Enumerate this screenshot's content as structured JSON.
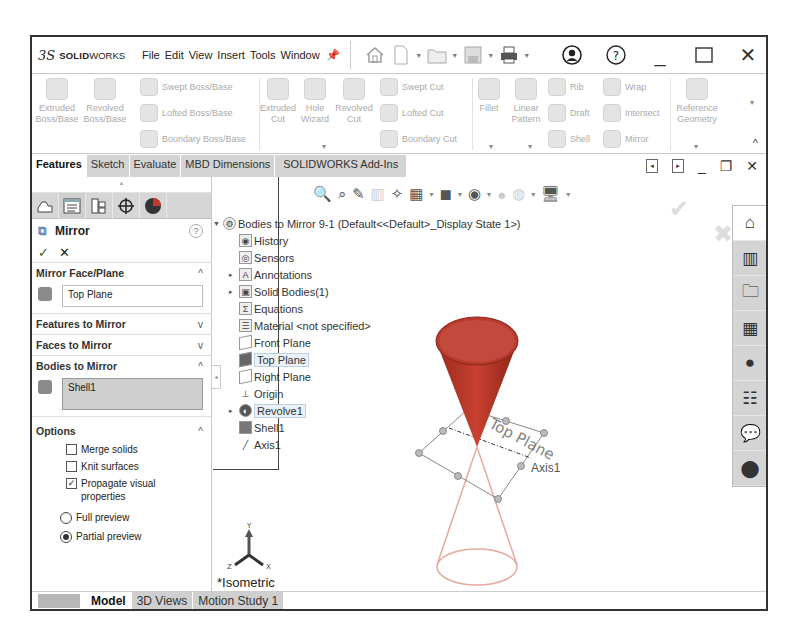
{
  "app": {
    "logo_prefix": "3S",
    "logo_bold": "SOLID",
    "logo_light": "WORKS"
  },
  "menu": [
    "File",
    "Edit",
    "View",
    "Insert",
    "Tools",
    "Window"
  ],
  "quick_access_icons": [
    "home-icon",
    "new-document-icon",
    "open-folder-icon",
    "save-icon",
    "print-icon"
  ],
  "window_controls": {
    "user_icon": "user-icon",
    "help_icon": "?",
    "minimize": "_",
    "maximize": "☐",
    "close": "✕"
  },
  "ribbon": {
    "extruded_boss": "Extruded Boss/Base",
    "revolved_boss": "Revolved Boss/Base",
    "swept_boss": "Swept Boss/Base",
    "lofted_boss": "Lofted Boss/Base",
    "boundary_boss": "Boundary Boss/Base",
    "extruded_cut": "Extruded Cut",
    "hole_wizard": "Hole Wizard",
    "revolved_cut": "Revolved Cut",
    "swept_cut": "Swept Cut",
    "lofted_cut": "Lofted Cut",
    "boundary_cut": "Boundary Cut",
    "fillet": "Fillet",
    "linear_pattern": "Linear Pattern",
    "rib": "Rib",
    "draft": "Draft",
    "shell": "Shell",
    "wrap": "Wrap",
    "intersect": "Intersect",
    "mirror": "Mirror",
    "reference_geometry": "Reference Geometry"
  },
  "command_tabs": [
    {
      "label": "Features",
      "active": true
    },
    {
      "label": "Sketch",
      "active": false
    },
    {
      "label": "Evaluate",
      "active": false
    },
    {
      "label": "MBD Dimensions",
      "active": false
    },
    {
      "label": "SOLIDWORKS Add-Ins",
      "active": false
    }
  ],
  "property_manager": {
    "title": "Mirror",
    "help": "?",
    "ok": "✓",
    "cancel": "✕",
    "mirror_face_plane": {
      "label": "Mirror Face/Plane",
      "value": "Top Plane"
    },
    "features_to_mirror": "Features to Mirror",
    "faces_to_mirror": "Faces to Mirror",
    "bodies_to_mirror": {
      "label": "Bodies to Mirror",
      "value": "Shell1"
    },
    "options": {
      "label": "Options",
      "merge_solids": {
        "label": "Merge solids",
        "checked": false
      },
      "knit_surfaces": {
        "label": "Knit surfaces",
        "checked": false
      },
      "propagate_visual": {
        "label": "Propagate visual properties",
        "checked": true
      },
      "full_preview": {
        "label": "Full preview",
        "selected": false
      },
      "partial_preview": {
        "label": "Partial preview",
        "selected": true
      }
    }
  },
  "feature_tree": {
    "root": "Bodies to Mirror 9-1  (Default<<Default>_Display State 1>)",
    "items": [
      {
        "label": "History",
        "expandable": false
      },
      {
        "label": "Sensors",
        "expandable": false
      },
      {
        "label": "Annotations",
        "expandable": true
      },
      {
        "label": "Solid Bodies(1)",
        "expandable": true
      },
      {
        "label": "Equations",
        "expandable": false
      },
      {
        "label": "Material <not specified>",
        "expandable": false
      },
      {
        "label": "Front Plane",
        "expandable": false
      },
      {
        "label": "Top Plane",
        "expandable": false,
        "highlighted": true
      },
      {
        "label": "Right Plane",
        "expandable": false
      },
      {
        "label": "Origin",
        "expandable": false
      },
      {
        "label": "Revolve1",
        "expandable": true,
        "highlighted": true
      },
      {
        "label": "Shell1",
        "expandable": false
      },
      {
        "label": "Axis1",
        "expandable": false
      }
    ]
  },
  "viewport": {
    "plane_label": "Top Plane",
    "axis_label": "Axis1",
    "view_orientation": "*Isometric",
    "triad": {
      "x": "X",
      "y": "Y",
      "z": "Z"
    },
    "cone_color": "#c0392b"
  },
  "bottom_tabs": [
    {
      "label": "Model",
      "active": true
    },
    {
      "label": "3D Views",
      "active": false
    },
    {
      "label": "Motion Study 1",
      "active": false
    }
  ]
}
